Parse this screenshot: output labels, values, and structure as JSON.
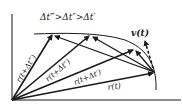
{
  "diagram": {
    "title_inequality": "Δt‴>Δt″>Δt′",
    "labels": {
      "r_t": "r(t)",
      "r_t_dt1": "r(t+Δt′)",
      "r_t_dt2": "r(t+Δt″)",
      "r_t_dt3": "r(t+Δt‴)",
      "v_t": "v(t)"
    },
    "colors": {
      "ink": "#1a1a1a",
      "background": "#ffffff"
    }
  }
}
